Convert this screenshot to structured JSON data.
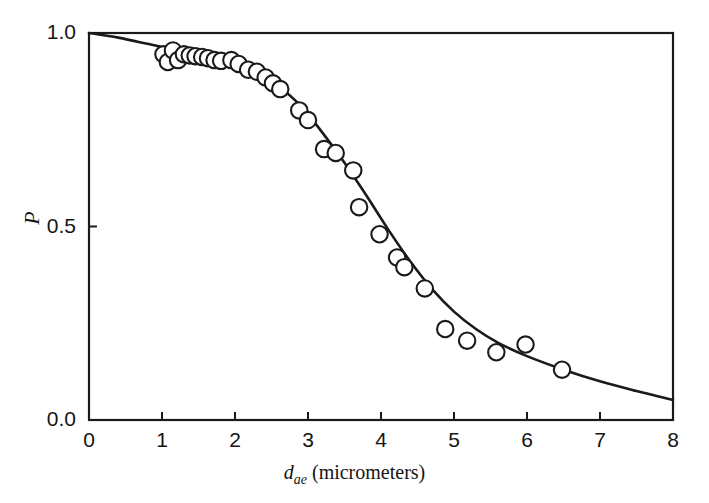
{
  "chart_data": {
    "type": "scatter",
    "title": "",
    "xlabel_parts": {
      "symbol": "d",
      "subscript": "ae",
      "units": "(micrometers)"
    },
    "xlabel": "d_ae (micrometers)",
    "ylabel": "P",
    "xlim": [
      0,
      8
    ],
    "ylim": [
      0.0,
      1.0
    ],
    "xticks": [
      0,
      1,
      2,
      3,
      4,
      5,
      6,
      7,
      8
    ],
    "xtick_labels": [
      "0",
      "1",
      "2",
      "3",
      "4",
      "5",
      "6",
      "7",
      "8"
    ],
    "yticks": [
      0.0,
      0.5,
      1.0
    ],
    "ytick_labels": [
      "0.0",
      "0.5",
      "1.0"
    ],
    "grid": false,
    "legend": null,
    "marker": "open-circle",
    "marker_color": "#ffffff",
    "marker_edge_color": "#1a1a1a",
    "line_color": "#1a1a1a",
    "axis_color": "#1a1a1a",
    "series": [
      {
        "name": "measured penetration",
        "type": "scatter",
        "points": [
          [
            1.02,
            0.945
          ],
          [
            1.08,
            0.925
          ],
          [
            1.15,
            0.955
          ],
          [
            1.22,
            0.93
          ],
          [
            1.3,
            0.945
          ],
          [
            1.38,
            0.942
          ],
          [
            1.46,
            0.94
          ],
          [
            1.55,
            0.938
          ],
          [
            1.63,
            0.935
          ],
          [
            1.72,
            0.93
          ],
          [
            1.81,
            0.928
          ],
          [
            1.95,
            0.93
          ],
          [
            2.05,
            0.92
          ],
          [
            2.18,
            0.905
          ],
          [
            2.3,
            0.9
          ],
          [
            2.42,
            0.885
          ],
          [
            2.52,
            0.87
          ],
          [
            2.62,
            0.855
          ],
          [
            2.88,
            0.8
          ],
          [
            3.0,
            0.775
          ],
          [
            3.22,
            0.7
          ],
          [
            3.38,
            0.69
          ],
          [
            3.62,
            0.645
          ],
          [
            3.7,
            0.55
          ],
          [
            3.98,
            0.48
          ],
          [
            4.22,
            0.42
          ],
          [
            4.32,
            0.395
          ],
          [
            4.6,
            0.34
          ],
          [
            4.88,
            0.235
          ],
          [
            5.18,
            0.205
          ],
          [
            5.58,
            0.175
          ],
          [
            5.98,
            0.195
          ],
          [
            6.48,
            0.13
          ]
        ]
      },
      {
        "name": "fitted penetration curve",
        "type": "line",
        "points": [
          [
            0.0,
            1.0
          ],
          [
            0.4,
            0.988
          ],
          [
            0.8,
            0.972
          ],
          [
            1.2,
            0.955
          ],
          [
            1.6,
            0.94
          ],
          [
            2.0,
            0.925
          ],
          [
            2.3,
            0.898
          ],
          [
            2.6,
            0.862
          ],
          [
            2.9,
            0.812
          ],
          [
            3.2,
            0.742
          ],
          [
            3.5,
            0.665
          ],
          [
            3.8,
            0.58
          ],
          [
            4.1,
            0.492
          ],
          [
            4.4,
            0.41
          ],
          [
            4.7,
            0.338
          ],
          [
            5.0,
            0.28
          ],
          [
            5.3,
            0.235
          ],
          [
            5.6,
            0.2
          ],
          [
            6.0,
            0.165
          ],
          [
            6.5,
            0.13
          ],
          [
            7.0,
            0.1
          ],
          [
            7.5,
            0.075
          ],
          [
            8.0,
            0.052
          ]
        ]
      }
    ]
  }
}
